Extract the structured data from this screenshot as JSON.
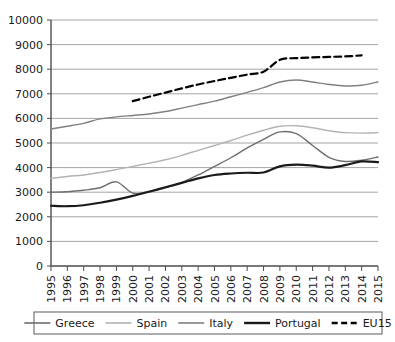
{
  "chart_data": {
    "type": "line",
    "title": "",
    "subtitle": "",
    "xlabel": "",
    "ylabel": "",
    "grid": true,
    "legend_position": "bottom",
    "xlim": [
      1995,
      2015
    ],
    "ylim": [
      0,
      10000
    ],
    "ytick_step": 1000,
    "x": [
      1995,
      1996,
      1997,
      1998,
      1999,
      2000,
      2001,
      2002,
      2003,
      2004,
      2005,
      2006,
      2007,
      2008,
      2009,
      2010,
      2011,
      2012,
      2013,
      2014,
      2015
    ],
    "categories": [
      "1995",
      "1996",
      "1997",
      "1998",
      "1999",
      "2000",
      "2001",
      "2002",
      "2003",
      "2004",
      "2005",
      "2006",
      "2007",
      "2008",
      "2009",
      "2010",
      "2011",
      "2012",
      "2013",
      "2014",
      "2015"
    ],
    "yticks": [
      "0",
      "1000",
      "2000",
      "3000",
      "4000",
      "5000",
      "6000",
      "7000",
      "8000",
      "9000",
      "10000"
    ],
    "series": [
      {
        "name": "Greece",
        "color": "#6e6e6e",
        "width": 1.4,
        "dash": "none",
        "values": [
          3000,
          3020,
          3080,
          3180,
          3420,
          2960,
          3030,
          3180,
          3400,
          3700,
          4050,
          4400,
          4800,
          5150,
          5450,
          5380,
          4900,
          4420,
          4250,
          4300,
          4430
        ]
      },
      {
        "name": "Spain",
        "color": "#b3b3b3",
        "width": 1.4,
        "dash": "none",
        "values": [
          3560,
          3640,
          3700,
          3800,
          3920,
          4050,
          4180,
          4320,
          4500,
          4700,
          4900,
          5100,
          5320,
          5520,
          5680,
          5700,
          5620,
          5500,
          5420,
          5400,
          5420
        ]
      },
      {
        "name": "Italy",
        "color": "#808080",
        "width": 1.4,
        "dash": "none",
        "values": [
          5570,
          5680,
          5800,
          5980,
          6060,
          6120,
          6180,
          6280,
          6420,
          6560,
          6700,
          6880,
          7060,
          7250,
          7480,
          7560,
          7480,
          7380,
          7320,
          7350,
          7480
        ]
      },
      {
        "name": "Portugal",
        "color": "#1a1a1a",
        "width": 2.2,
        "dash": "none",
        "values": [
          2450,
          2430,
          2470,
          2570,
          2700,
          2850,
          3020,
          3200,
          3380,
          3560,
          3700,
          3760,
          3790,
          3800,
          4050,
          4120,
          4080,
          4000,
          4100,
          4250,
          4220
        ]
      },
      {
        "name": "EU15",
        "color": "#000000",
        "width": 2.2,
        "dash": "dashed",
        "values": [
          null,
          null,
          null,
          null,
          null,
          6700,
          6880,
          7050,
          7220,
          7380,
          7520,
          7650,
          7780,
          7900,
          8380,
          8450,
          8480,
          8500,
          8520,
          8560,
          null
        ]
      }
    ],
    "legend": [
      {
        "label": "Greece",
        "color": "#6e6e6e",
        "dash": "none",
        "width": 1.6
      },
      {
        "label": "Spain",
        "color": "#b3b3b3",
        "dash": "none",
        "width": 1.6
      },
      {
        "label": "Italy",
        "color": "#808080",
        "dash": "none",
        "width": 1.6
      },
      {
        "label": "Portugal",
        "color": "#1a1a1a",
        "dash": "none",
        "width": 2.4
      },
      {
        "label": "EU15",
        "color": "#000000",
        "dash": "dashed",
        "width": 2.4
      }
    ]
  },
  "colors": {
    "axis": "#4d4d4d",
    "grid": "#9a9a9a",
    "text": "#1a1a1a",
    "background": "#ffffff",
    "legend_border": "#5a5a5a"
  }
}
